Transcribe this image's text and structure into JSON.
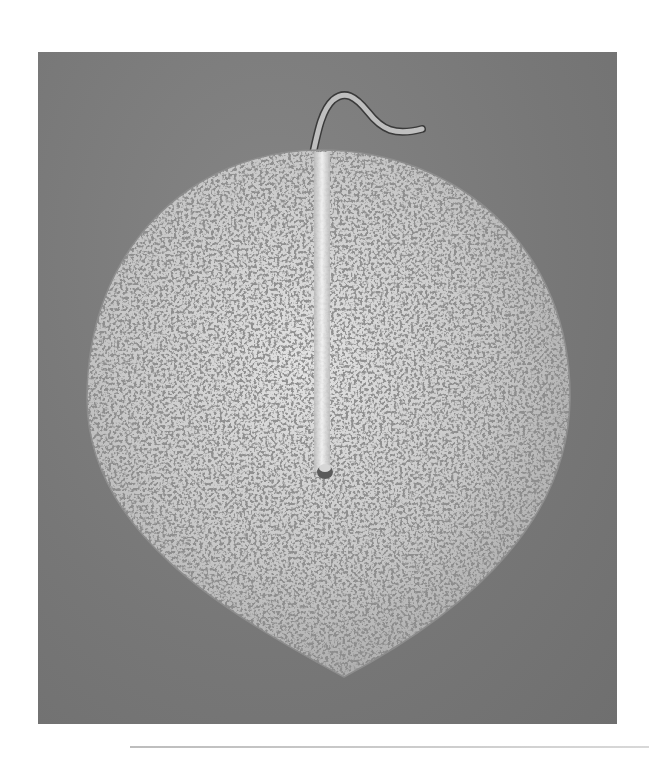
{
  "image": {
    "subject": "Round leaf-shaped polished metal mirror with hooked handle",
    "background_color": "#7b7b7b",
    "object_color": "#c9c9c9",
    "page_color": "#ffffff"
  },
  "scene": {
    "panel": {
      "x": 38,
      "y": 52,
      "width": 579,
      "height": 672
    },
    "object": {
      "left": 86,
      "right": 570,
      "top": 150,
      "bottom_tip": [
        344,
        677
      ]
    },
    "handle": {
      "base": [
        322,
        150
      ],
      "apex": [
        330,
        95
      ],
      "end": [
        423,
        130
      ]
    },
    "rule": {
      "x": 130,
      "y": 746,
      "width": 519
    }
  }
}
